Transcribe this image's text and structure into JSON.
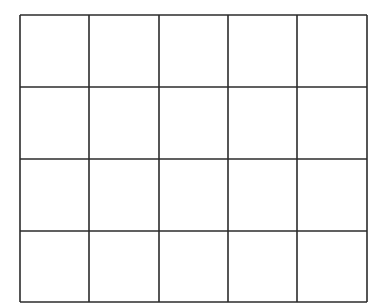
{
  "diagram": {
    "type": "empty-grid",
    "rows": 4,
    "columns": 5,
    "line_color": "#2b2b2b",
    "background": "#ffffff",
    "x_lines": [
      20,
      89,
      159,
      228,
      297,
      367
    ],
    "y_lines": [
      15,
      87,
      159,
      231,
      302
    ],
    "cell_text": []
  }
}
